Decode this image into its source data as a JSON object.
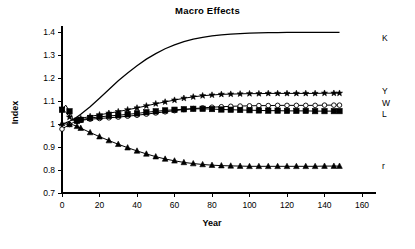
{
  "chart_data": {
    "type": "line",
    "title": "Macro Effects",
    "xlabel": "Year",
    "ylabel": "Index",
    "xlim": [
      0,
      160
    ],
    "ylim": [
      0.7,
      1.4
    ],
    "xticks": [
      0,
      20,
      40,
      60,
      80,
      100,
      120,
      140,
      160
    ],
    "xtick_labels": [
      "0",
      "20",
      "40",
      "60",
      "80",
      "100",
      "120",
      "140",
      "160"
    ],
    "yticks": [
      0.7,
      0.8,
      0.9,
      1.0,
      1.1,
      1.2,
      1.3,
      1.4
    ],
    "ytick_labels": [
      "0.7",
      "0.8",
      "0.9",
      "1",
      "1.1",
      "1.2",
      "1.3",
      "1.4"
    ],
    "grid": false,
    "legend_position": "right-inline",
    "x": [
      0,
      2,
      4,
      6,
      8,
      10,
      15,
      20,
      25,
      30,
      35,
      40,
      45,
      50,
      55,
      60,
      65,
      70,
      75,
      80,
      85,
      90,
      95,
      100,
      105,
      110,
      115,
      120,
      125,
      130,
      135,
      140,
      145,
      148
    ],
    "series": [
      {
        "name": "K",
        "label": "K",
        "marker": "none",
        "line": "solid-thick",
        "values": [
          1.0,
          1.005,
          1.012,
          1.02,
          1.03,
          1.042,
          1.075,
          1.112,
          1.15,
          1.188,
          1.222,
          1.253,
          1.282,
          1.306,
          1.327,
          1.344,
          1.358,
          1.369,
          1.377,
          1.383,
          1.388,
          1.391,
          1.393,
          1.395,
          1.396,
          1.397,
          1.397,
          1.398,
          1.398,
          1.398,
          1.398,
          1.398,
          1.398,
          1.398
        ]
      },
      {
        "name": "Y",
        "label": "Y",
        "marker": "star-filled",
        "line": "solid",
        "values": [
          1.068,
          1.052,
          1.03,
          1.014,
          1.018,
          1.024,
          1.033,
          1.04,
          1.047,
          1.054,
          1.062,
          1.07,
          1.079,
          1.088,
          1.096,
          1.104,
          1.112,
          1.118,
          1.123,
          1.126,
          1.129,
          1.13,
          1.131,
          1.132,
          1.132,
          1.133,
          1.133,
          1.133,
          1.133,
          1.133,
          1.133,
          1.134,
          1.134,
          1.134
        ]
      },
      {
        "name": "W",
        "label": "W",
        "marker": "circle-open",
        "line": "solid",
        "values": [
          0.978,
          0.988,
          0.998,
          1.006,
          1.012,
          1.016,
          1.021,
          1.024,
          1.027,
          1.03,
          1.034,
          1.038,
          1.043,
          1.048,
          1.053,
          1.058,
          1.063,
          1.067,
          1.07,
          1.073,
          1.075,
          1.077,
          1.078,
          1.079,
          1.08,
          1.08,
          1.081,
          1.081,
          1.081,
          1.081,
          1.081,
          1.082,
          1.082,
          1.082
        ]
      },
      {
        "name": "L",
        "label": "L",
        "marker": "square-filled",
        "line": "solid",
        "values": [
          1.062,
          1.082,
          1.055,
          1.018,
          1.014,
          1.018,
          1.026,
          1.031,
          1.035,
          1.038,
          1.042,
          1.046,
          1.051,
          1.055,
          1.059,
          1.062,
          1.064,
          1.066,
          1.066,
          1.065,
          1.063,
          1.062,
          1.061,
          1.06,
          1.059,
          1.058,
          1.058,
          1.057,
          1.057,
          1.057,
          1.056,
          1.056,
          1.056,
          1.056
        ]
      },
      {
        "name": "r",
        "label": "r",
        "marker": "triangle-filled",
        "line": "solid",
        "values": [
          1.002,
          1.0,
          0.998,
          0.996,
          0.99,
          0.982,
          0.963,
          0.945,
          0.928,
          0.912,
          0.897,
          0.883,
          0.87,
          0.858,
          0.848,
          0.84,
          0.833,
          0.828,
          0.824,
          0.821,
          0.819,
          0.818,
          0.817,
          0.816,
          0.816,
          0.816,
          0.816,
          0.816,
          0.816,
          0.816,
          0.816,
          0.817,
          0.817,
          0.817
        ]
      }
    ]
  }
}
